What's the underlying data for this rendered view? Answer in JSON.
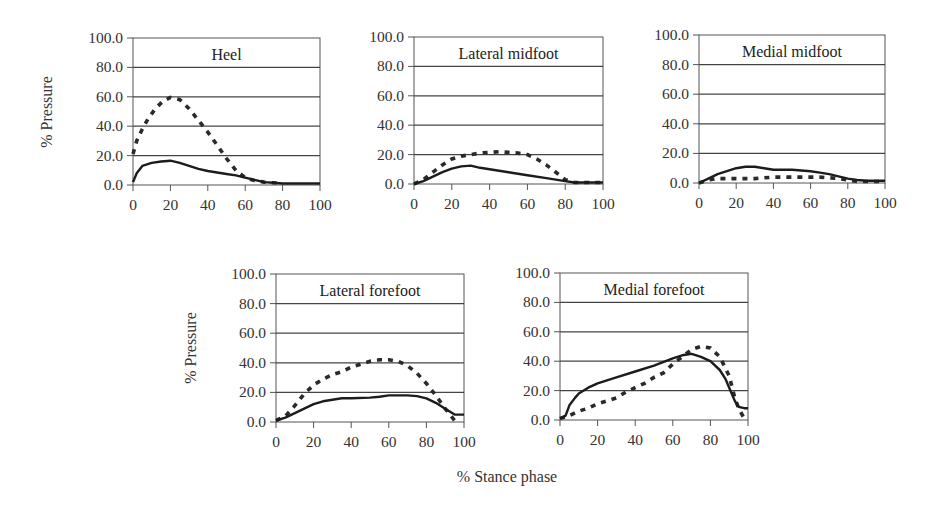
{
  "figure": {
    "y_axis_label": "% Pressure",
    "x_axis_label": "% Stance phase"
  },
  "chart_data": [
    {
      "type": "line",
      "title": "Heel",
      "xlabel": "",
      "ylabel": "% Pressure",
      "xlim": [
        0,
        100
      ],
      "ylim": [
        0,
        100
      ],
      "x_ticks": [
        "0",
        "20",
        "40",
        "60",
        "80",
        "100"
      ],
      "y_ticks": [
        "0.0",
        "20.0",
        "40.0",
        "60.0",
        "80.0",
        "100.0"
      ],
      "grid": true,
      "legend": "none",
      "series": [
        {
          "name": "solid",
          "style": "solid",
          "x": [
            0,
            2,
            5,
            10,
            15,
            20,
            25,
            30,
            35,
            40,
            45,
            50,
            55,
            60,
            65,
            70,
            75,
            80,
            90,
            100
          ],
          "values": [
            2,
            8,
            13,
            15,
            16,
            16.5,
            15,
            13,
            11,
            9.5,
            8.5,
            7.5,
            6.5,
            5,
            3.5,
            2,
            1.5,
            1,
            1,
            1
          ]
        },
        {
          "name": "dashed",
          "style": "dashed",
          "x": [
            0,
            2,
            5,
            8,
            12,
            16,
            20,
            25,
            30,
            35,
            40,
            45,
            50,
            55,
            60,
            65,
            70,
            75,
            80
          ],
          "values": [
            21,
            30,
            38,
            45,
            52,
            57,
            59.5,
            58,
            52,
            44,
            36,
            27,
            18,
            10,
            5,
            3,
            2,
            1.5,
            1
          ]
        }
      ]
    },
    {
      "type": "line",
      "title": "Lateral midfoot",
      "xlabel": "",
      "ylabel": "",
      "xlim": [
        0,
        100
      ],
      "ylim": [
        0,
        100
      ],
      "x_ticks": [
        "0",
        "20",
        "40",
        "60",
        "80",
        "100"
      ],
      "y_ticks": [
        "0.0",
        "20.0",
        "40.0",
        "60.0",
        "80.0",
        "100.0"
      ],
      "grid": true,
      "legend": "none",
      "series": [
        {
          "name": "solid",
          "style": "solid",
          "x": [
            0,
            5,
            10,
            15,
            20,
            25,
            30,
            35,
            40,
            50,
            60,
            70,
            80,
            85,
            90,
            100
          ],
          "values": [
            0,
            2,
            5,
            8,
            10.5,
            12,
            12.5,
            11,
            10,
            8,
            6,
            4,
            2,
            1,
            1,
            1
          ]
        },
        {
          "name": "dashed",
          "style": "dashed",
          "x": [
            0,
            5,
            10,
            15,
            20,
            25,
            30,
            35,
            40,
            45,
            50,
            55,
            60,
            65,
            70,
            75,
            80,
            85,
            90,
            100
          ],
          "values": [
            0,
            3,
            8,
            13,
            17,
            19,
            20,
            21,
            21.5,
            22,
            21.5,
            21,
            20,
            17,
            13,
            8,
            3,
            1,
            1,
            1
          ]
        }
      ]
    },
    {
      "type": "line",
      "title": "Medial midfoot",
      "xlabel": "",
      "ylabel": "",
      "xlim": [
        0,
        100
      ],
      "ylim": [
        0,
        100
      ],
      "x_ticks": [
        "0",
        "20",
        "40",
        "60",
        "80",
        "100"
      ],
      "y_ticks": [
        "0.0",
        "20.0",
        "40.0",
        "60.0",
        "80.0",
        "100.0"
      ],
      "grid": true,
      "legend": "none",
      "series": [
        {
          "name": "solid",
          "style": "solid",
          "x": [
            0,
            5,
            10,
            15,
            20,
            25,
            30,
            35,
            40,
            50,
            60,
            65,
            70,
            75,
            80,
            85,
            90,
            100
          ],
          "values": [
            0,
            3,
            6,
            8,
            10,
            11,
            11,
            10,
            9,
            9,
            8,
            7,
            6,
            4.5,
            3,
            2,
            1.5,
            1.5
          ]
        },
        {
          "name": "dashed",
          "style": "dashed",
          "x": [
            0,
            5,
            10,
            20,
            30,
            40,
            50,
            60,
            65,
            70,
            75,
            80,
            85,
            90,
            100
          ],
          "values": [
            0,
            2,
            3,
            3,
            3,
            4,
            4,
            4,
            4,
            3.5,
            3,
            2,
            1,
            1,
            1
          ]
        }
      ]
    },
    {
      "type": "line",
      "title": "Lateral forefoot",
      "xlabel": "",
      "ylabel": "% Pressure",
      "xlim": [
        0,
        100
      ],
      "ylim": [
        0,
        100
      ],
      "x_ticks": [
        "0",
        "20",
        "40",
        "60",
        "80",
        "100"
      ],
      "y_ticks": [
        "0.0",
        "20.0",
        "40.0",
        "60.0",
        "80.0",
        "100.0"
      ],
      "grid": true,
      "legend": "none",
      "series": [
        {
          "name": "solid",
          "style": "solid",
          "x": [
            0,
            5,
            10,
            15,
            20,
            25,
            30,
            35,
            40,
            50,
            55,
            60,
            65,
            70,
            75,
            80,
            85,
            90,
            95,
            100
          ],
          "values": [
            1,
            3,
            6,
            9,
            12,
            14,
            15,
            16,
            16,
            16.5,
            17,
            18,
            18,
            18,
            17.5,
            16,
            13,
            9,
            5,
            5
          ]
        },
        {
          "name": "dashed",
          "style": "dashed",
          "x": [
            0,
            5,
            10,
            15,
            20,
            25,
            30,
            35,
            40,
            45,
            50,
            55,
            60,
            65,
            70,
            75,
            80,
            85,
            90,
            95
          ],
          "values": [
            1,
            4,
            11,
            19,
            25,
            29,
            32,
            34,
            37,
            39,
            41,
            42,
            42,
            41,
            38,
            33,
            26,
            18,
            9,
            1
          ]
        }
      ]
    },
    {
      "type": "line",
      "title": "Medial forefoot",
      "xlabel": "% Stance phase",
      "ylabel": "",
      "xlim": [
        0,
        100
      ],
      "ylim": [
        0,
        100
      ],
      "x_ticks": [
        "0",
        "20",
        "40",
        "60",
        "80",
        "100"
      ],
      "y_ticks": [
        "0.0",
        "20.0",
        "40.0",
        "60.0",
        "80.0",
        "100.0"
      ],
      "grid": true,
      "legend": "none",
      "series": [
        {
          "name": "solid",
          "style": "solid",
          "x": [
            0,
            3,
            5,
            8,
            10,
            15,
            20,
            30,
            40,
            50,
            60,
            65,
            70,
            75,
            80,
            85,
            88,
            90,
            93,
            95,
            98,
            100
          ],
          "values": [
            1,
            3,
            10,
            15,
            18,
            22,
            25,
            29,
            33,
            37,
            42,
            44,
            45,
            43,
            40,
            34,
            28,
            22,
            13,
            9,
            8,
            8
          ]
        },
        {
          "name": "dashed",
          "style": "dashed",
          "x": [
            0,
            5,
            10,
            15,
            20,
            25,
            30,
            35,
            40,
            45,
            50,
            55,
            60,
            65,
            70,
            75,
            80,
            85,
            90,
            93,
            95,
            98
          ],
          "values": [
            1,
            3,
            6,
            8,
            11,
            13,
            15,
            19,
            22,
            25,
            29,
            32,
            38,
            43,
            48,
            50,
            49,
            43,
            30,
            15,
            8,
            1
          ]
        }
      ]
    }
  ]
}
